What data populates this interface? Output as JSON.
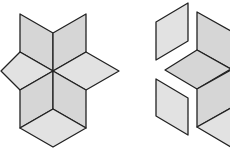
{
  "diagram": {
    "type": "geometric-tiling",
    "colors": {
      "fill_light": "#e2e2e2",
      "fill_mid": "#d6d6d6",
      "stroke": "#222222",
      "background": "#ffffff"
    },
    "figures": [
      {
        "name": "assembled-star",
        "rhombi": [
          {
            "name": "top-left",
            "points": "20,14 53,33 53,71 20,52",
            "shade": "mid"
          },
          {
            "name": "top-right",
            "points": "86,14 53,33 53,71 86,52",
            "shade": "mid"
          },
          {
            "name": "left",
            "points": "1,71 20,52 53,71 20,90",
            "shade": "light"
          },
          {
            "name": "right",
            "points": "53,71 86,52 119,71 86,90",
            "shade": "light"
          },
          {
            "name": "bottom-left",
            "points": "20,90 53,71 53,109 20,128",
            "shade": "mid"
          },
          {
            "name": "bottom-right",
            "points": "86,90 53,71 53,109 86,128",
            "shade": "mid"
          },
          {
            "name": "bottom",
            "points": "20,128 53,109 86,128 53,147",
            "shade": "light"
          }
        ]
      },
      {
        "name": "separated-pieces",
        "rhombi": [
          {
            "name": "piece-upper-left",
            "points": "156,22 188,3 188,41 156,60",
            "shade": "light"
          },
          {
            "name": "piece-upper-right",
            "points": "197,12 231,31 231,69 197,50",
            "shade": "mid"
          },
          {
            "name": "piece-middle",
            "points": "165,70 197,50 231,69 197,89",
            "shade": "mid"
          },
          {
            "name": "piece-lower-left",
            "points": "156,79 188,98 188,135 156,116",
            "shade": "light"
          },
          {
            "name": "piece-lower-right",
            "points": "197,89 231,70 231,108 197,127",
            "shade": "mid"
          },
          {
            "name": "piece-bottom",
            "points": "197,127 231,108 231,146 231,147",
            "shade": "light"
          }
        ]
      }
    ]
  }
}
